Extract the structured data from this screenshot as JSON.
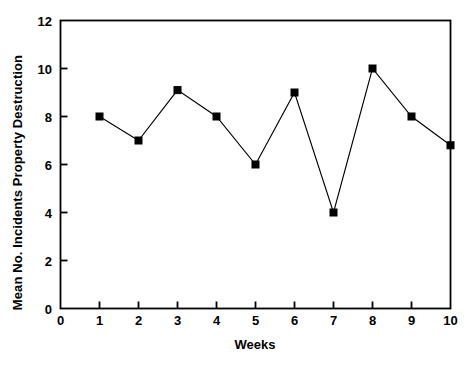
{
  "chart_data": {
    "type": "line",
    "title": "",
    "subtitle": "",
    "xlabel": "Weeks",
    "ylabel": "Mean No. Incidents Property Destruction",
    "x": [
      1,
      2,
      3,
      4,
      5,
      6,
      7,
      8,
      9,
      10
    ],
    "values": [
      8.0,
      7.0,
      9.1,
      8.0,
      6.0,
      9.0,
      4.0,
      10.0,
      8.0,
      6.8
    ],
    "series": [
      {
        "name": "Mean No. Incidents Property Destruction",
        "values": [
          8.0,
          7.0,
          9.1,
          8.0,
          6.0,
          9.0,
          4.0,
          10.0,
          8.0,
          6.8
        ]
      }
    ],
    "xlim": [
      0,
      10
    ],
    "ylim": [
      0,
      12
    ],
    "xticks": [
      0,
      1,
      2,
      3,
      4,
      5,
      6,
      7,
      8,
      9,
      10
    ],
    "yticks": [
      0,
      2,
      4,
      6,
      8,
      10,
      12
    ],
    "xtick_labels": [
      "0",
      "1",
      "2",
      "3",
      "4",
      "5",
      "6",
      "7",
      "8",
      "9",
      "10"
    ],
    "ytick_labels": [
      "0",
      "2",
      "4",
      "6",
      "8",
      "10",
      "12"
    ],
    "grid": false,
    "legend": false,
    "legend_position": "none",
    "marker": "square",
    "line_color": "#000000",
    "marker_color": "#000000",
    "axis_color": "#000000",
    "background_color": "#ffffff"
  }
}
